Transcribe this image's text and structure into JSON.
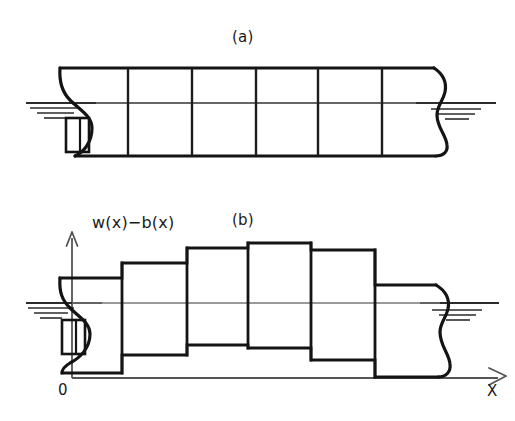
{
  "figure": {
    "panels": [
      {
        "id": "a",
        "caption": "(a)",
        "description": "continuous ship hull profile with station grid",
        "stations": 5,
        "sections": 6
      },
      {
        "id": "b",
        "caption": "(b)",
        "description": "stepwise (discretized) hull representation",
        "y_label": "w(x)−b(x)",
        "x_label": "X",
        "origin_label": "0"
      }
    ],
    "colors": {
      "ink": "#111111",
      "hull_line": "#161616",
      "grid_line": "#2a2a2a",
      "waterline": "#3c3c3c",
      "axis": "#555555",
      "background": "#ffffff"
    },
    "panel_a": {
      "hull": {
        "deck_y": 68,
        "keel_y": 156,
        "waterline_y": 103,
        "bow_x": 60,
        "stern_x": 447
      },
      "station_x": [
        128,
        192,
        256,
        318,
        382
      ],
      "waterline_left_x": [
        26,
        95
      ],
      "waterline_right_x": [
        418,
        495
      ],
      "hatch_left": [
        {
          "y": 108,
          "x1": 30,
          "x2": 78
        },
        {
          "y": 113,
          "x1": 36,
          "x2": 72
        },
        {
          "y": 118,
          "x1": 42,
          "x2": 66
        }
      ],
      "hatch_right": [
        {
          "y": 109,
          "x1": 430,
          "x2": 478
        },
        {
          "y": 114,
          "x1": 436,
          "x2": 472
        },
        {
          "y": 119,
          "x1": 442,
          "x2": 466
        }
      ],
      "bulb": {
        "x": 66,
        "y": 118,
        "w": 22,
        "h": 33
      }
    },
    "panel_b": {
      "axis": {
        "origin_x": 72,
        "origin_y": 378,
        "y_top": 233,
        "x_right": 505,
        "waterline_y": 303
      },
      "waterline_left_x": [
        26,
        100
      ],
      "waterline_right_x": [
        420,
        498
      ],
      "hatch_left": [
        {
          "y": 308,
          "x1": 28,
          "x2": 72
        },
        {
          "y": 313,
          "x1": 34,
          "x2": 66
        },
        {
          "y": 318,
          "x1": 40,
          "x2": 60
        }
      ],
      "hatch_right": [
        {
          "y": 310,
          "x1": 432,
          "x2": 480
        },
        {
          "y": 315,
          "x1": 438,
          "x2": 474
        },
        {
          "y": 320,
          "x1": 444,
          "x2": 468
        }
      ],
      "bulb": {
        "x": 63,
        "y": 320,
        "w": 22,
        "h": 33
      },
      "steps": [
        {
          "x0": 60,
          "x1": 122,
          "top": 278,
          "bottom": 373
        },
        {
          "x0": 122,
          "x1": 187,
          "top": 263,
          "bottom": 355
        },
        {
          "x0": 187,
          "x1": 248,
          "top": 248,
          "bottom": 345
        },
        {
          "x0": 248,
          "x1": 311,
          "top": 243,
          "bottom": 348
        },
        {
          "x0": 311,
          "x1": 375,
          "top": 250,
          "bottom": 360
        },
        {
          "x0": 375,
          "x1": 447,
          "top": 285,
          "bottom": 377
        }
      ]
    }
  }
}
